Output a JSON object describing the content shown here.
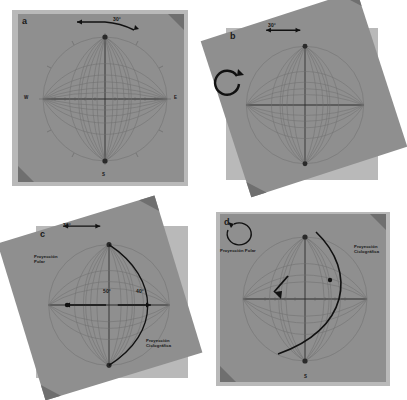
{
  "figure": {
    "panel_count": 4,
    "colors": {
      "tracing_paper": "#b9b9b9",
      "wulff_net_sheet": "#8f8f8f",
      "annotation": "#141414",
      "net_lines": "#6a6a6a",
      "page_background": "#ffffff",
      "fold_shadow": "#6f6f6f"
    }
  },
  "panels": [
    {
      "id": "a",
      "label": "a",
      "rotation_deg": 0,
      "description": "Red de Wulff con papel de calco alineado al norte",
      "angle_annotation": {
        "value": "30°",
        "type": "strike-arc"
      },
      "compass": {
        "north": "N",
        "east": "E",
        "south": "S",
        "west": "W"
      },
      "captions": []
    },
    {
      "id": "b",
      "label": "b",
      "rotation_deg": -18,
      "description": "Papel de calco girado el valor del rumbo sobre la red",
      "angle_annotation": {
        "value": "30°",
        "type": "strike-arc"
      },
      "rotation_arrow": {
        "present": true,
        "direction": "counter-clockwise"
      },
      "compass": {
        "north": "N",
        "east": "E",
        "south": "S",
        "west": "W"
      },
      "captions": []
    },
    {
      "id": "c",
      "label": "c",
      "rotation_deg": -18,
      "description": "Trazado del arco ciclografico y del polo del plano",
      "angle_annotation": {
        "value": "30°",
        "type": "strike-arc"
      },
      "dip_annotation": {
        "value": "50°",
        "type": "dip-measure"
      },
      "pole_annotation": {
        "value": "40°",
        "type": "pole-measure"
      },
      "captions": [
        {
          "text": "Proyección Polar",
          "position": "left"
        },
        {
          "text": "Proyección Ciclográfica",
          "position": "bottom-right"
        }
      ]
    },
    {
      "id": "d",
      "label": "d",
      "rotation_deg": 0,
      "description": "Resultado final con el papel de calco devuelto al norte",
      "rotation_arrow": {
        "present": true,
        "direction": "clockwise"
      },
      "compass": {
        "north": "N",
        "east": "E",
        "south": "S",
        "west": "W"
      },
      "captions": [
        {
          "text": "Proyección Polar",
          "position": "left"
        },
        {
          "text": "Proyección Ciclográfica",
          "position": "right"
        }
      ]
    }
  ]
}
